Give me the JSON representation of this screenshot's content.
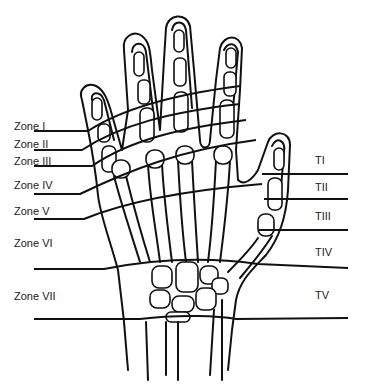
{
  "figure": {
    "colors": {
      "line": "#111111",
      "background": "#ffffff",
      "text": "#222222"
    },
    "finger_zones": [
      {
        "label": "Zone I"
      },
      {
        "label": "Zone II"
      },
      {
        "label": "Zone III"
      },
      {
        "label": "Zone IV"
      },
      {
        "label": "Zone V"
      },
      {
        "label": "Zone VI"
      },
      {
        "label": "Zone VII"
      }
    ],
    "thumb_zones": [
      {
        "label": "TI"
      },
      {
        "label": "TII"
      },
      {
        "label": "TIII"
      },
      {
        "label": "TIV"
      },
      {
        "label": "TV"
      }
    ]
  }
}
